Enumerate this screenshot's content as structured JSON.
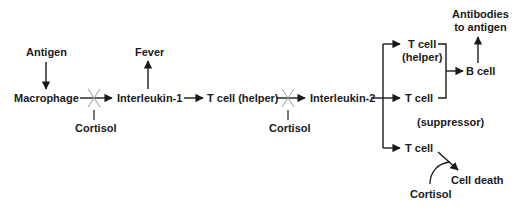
{
  "diagram": {
    "nodes": {
      "antigen": "Antigen",
      "macrophage": "Macrophage",
      "cortisol_1": "Cortisol",
      "fever": "Fever",
      "interleukin_1": "Interleukin-1",
      "t_cell_helper_1": "T cell (helper)",
      "cortisol_2": "Cortisol",
      "interleukin_2": "Interleukin-2",
      "t_cell_helper_2_line1": "T cell",
      "t_cell_helper_2_line2": "(helper)",
      "t_cell_suppressor_line1": "T cell",
      "t_cell_suppressor_line2": "(suppressor)",
      "t_cell_3": "T cell",
      "b_cell": "B cell",
      "antibodies_line1": "Antibodies",
      "antibodies_line2": "to antigen",
      "cell_death": "Cell death",
      "cortisol_3": "Cortisol"
    },
    "edges": [
      {
        "from": "Antigen",
        "to": "Macrophage",
        "type": "arrow"
      },
      {
        "from": "Macrophage",
        "to": "Interleukin-1",
        "type": "arrow",
        "blocked_by": "Cortisol"
      },
      {
        "from": "Interleukin-1",
        "to": "Fever",
        "type": "arrow"
      },
      {
        "from": "Interleukin-1",
        "to": "T cell (helper)",
        "type": "arrow"
      },
      {
        "from": "T cell (helper)",
        "to": "Interleukin-2",
        "type": "arrow",
        "blocked_by": "Cortisol"
      },
      {
        "from": "Interleukin-2",
        "to": "T cell (helper)",
        "type": "arrow"
      },
      {
        "from": "Interleukin-2",
        "to": "T cell (suppressor)",
        "type": "arrow"
      },
      {
        "from": "Interleukin-2",
        "to": "T cell",
        "type": "arrow"
      },
      {
        "from": "T cell (helper)",
        "to": "B cell",
        "type": "bracket-arrow"
      },
      {
        "from": "T cell (suppressor)",
        "to": "B cell",
        "type": "bracket-arrow"
      },
      {
        "from": "B cell",
        "to": "Antibodies to antigen",
        "type": "arrow"
      },
      {
        "from": "T cell",
        "to": "Cell death",
        "type": "arrow",
        "promoted_by": "Cortisol"
      }
    ],
    "colors": {
      "ink": "#1a1a1a",
      "background": "#ffffff",
      "inhibition_mark": "#9a9a9a"
    }
  }
}
